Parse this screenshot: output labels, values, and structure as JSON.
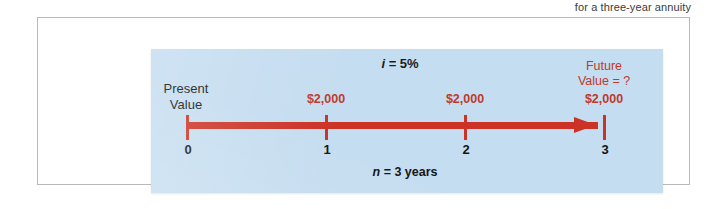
{
  "caption": {
    "text": "for a three-year annuity"
  },
  "figure": {
    "interest_rate_label": "i = 5%",
    "interest_rate_symbol": "i",
    "interest_rate_value": "= 5%",
    "present_value_line1": "Present",
    "present_value_line2": "Value",
    "future_value_line1": "Future",
    "future_value_line2": "Value = ?",
    "periods_label": "n = 3 years",
    "periods_symbol": "n",
    "periods_value": "= 3 years",
    "cash_flows": [
      {
        "label": "$2,000",
        "period": "1"
      },
      {
        "label": "$2,000",
        "period": "2"
      },
      {
        "label": "$2,000",
        "period": "3"
      }
    ],
    "ticks": [
      {
        "label": "0"
      },
      {
        "label": "1"
      },
      {
        "label": "2"
      },
      {
        "label": "3"
      }
    ],
    "colors": {
      "panel_background": "#c5ddf0",
      "timeline_red": "#cc3326",
      "text_black": "#141414",
      "accent_red_text": "#c0392b",
      "frame_border": "#b9b9b9"
    }
  }
}
